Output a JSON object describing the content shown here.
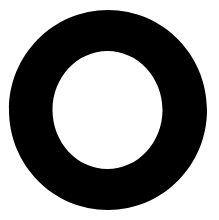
{
  "canvas": {
    "width": 219,
    "height": 220,
    "background_color": "#ffffff",
    "name": "ring-glyph-image"
  },
  "glyph": {
    "label": "O",
    "description": "Solid black annulus (ring / donut) on white background",
    "icon_name": "ring-icon",
    "fill_color": "#000000",
    "hole_color": "#ffffff",
    "outer": {
      "center_x": 108,
      "center_y": 110,
      "radius_x": 99,
      "radius_y": 100,
      "diameter": 199,
      "left": 9,
      "right": 207,
      "top": 10,
      "bottom": 210
    },
    "inner": {
      "center_x": 107.5,
      "center_y": 110,
      "radius_x": 55,
      "radius_y": 59,
      "diameter": 110,
      "left": 53,
      "right": 162,
      "top": 51,
      "bottom": 169
    },
    "stroke_thickness": 44
  }
}
